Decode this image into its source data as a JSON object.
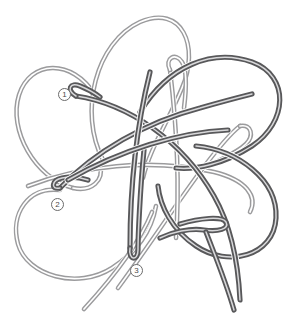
{
  "figure": {
    "width": 299,
    "height": 313,
    "background_color": "#ffffff",
    "strand_style": "double-outline tube",
    "colors": {
      "dark_strand": "#58585a",
      "mid_strand": "#7a7a7c",
      "light_strand": "#a8a8aa",
      "callout_ring": "#6b6b6b",
      "callout_text": "#4a4a4a"
    }
  },
  "callouts": [
    {
      "id": "callout-1",
      "label": "①",
      "number": "1",
      "x": 58,
      "y": 88
    },
    {
      "id": "callout-2",
      "label": "②",
      "number": "2",
      "x": 51,
      "y": 198
    },
    {
      "id": "callout-3",
      "label": "③",
      "number": "3",
      "x": 130,
      "y": 264
    }
  ],
  "strands": {
    "count": 5,
    "loop_names": [
      "top-loop",
      "upper-left-loop",
      "upper-right-loop",
      "lower-left-loop",
      "lower-right-loop"
    ],
    "loose_ends": 2
  }
}
